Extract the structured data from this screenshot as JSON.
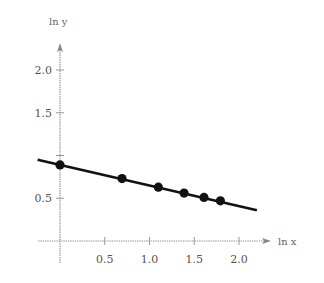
{
  "chart_data": {
    "type": "scatter",
    "title": "",
    "xlabel": "ln x",
    "ylabel": "ln y",
    "x_ticks": [
      "0.5",
      "1.0",
      "1.5",
      "2.0"
    ],
    "y_ticks": [
      "0.5",
      "1.5",
      "2.0"
    ],
    "xlim": [
      -0.25,
      2.35
    ],
    "ylim": [
      -0.05,
      2.3
    ],
    "grid": false,
    "legend": null,
    "points": [
      {
        "x": 0.0,
        "y": 0.89
      },
      {
        "x": 0.693,
        "y": 0.73
      },
      {
        "x": 1.099,
        "y": 0.63
      },
      {
        "x": 1.386,
        "y": 0.56
      },
      {
        "x": 1.609,
        "y": 0.51
      },
      {
        "x": 1.792,
        "y": 0.47
      }
    ],
    "fit_line": {
      "x_start": -0.25,
      "y_start": 0.95,
      "x_end": 2.2,
      "y_end": 0.36
    }
  }
}
